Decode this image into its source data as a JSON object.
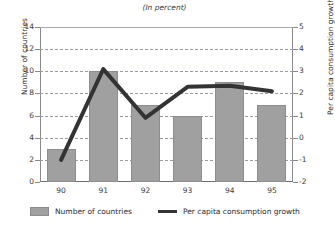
{
  "title": "Number of countries",
  "subtitle": "(In percent)",
  "chart_data": {
    "type": "bar",
    "title": "",
    "subtitle": "(In percent)",
    "xlabel": "",
    "categories": [
      "90",
      "91",
      "92",
      "93",
      "94",
      "95"
    ],
    "grid": true,
    "legend_position": "bottom",
    "series": [
      {
        "name": "Number of countries",
        "type": "bar",
        "axis": "left",
        "color": "#a0a0a0",
        "values": [
          3,
          10,
          7,
          6,
          9,
          7
        ]
      },
      {
        "name": "Per capita consumption growth",
        "type": "line",
        "axis": "right",
        "color": "#333333",
        "values": [
          -1.0,
          3.1,
          0.9,
          2.3,
          2.35,
          2.1
        ]
      }
    ],
    "left_axis": {
      "label": "Number of countries",
      "ylim": [
        0,
        14
      ],
      "ticks": [
        0,
        2,
        4,
        6,
        8,
        10,
        12,
        14
      ],
      "ticklabels": [
        "0",
        "2",
        "4",
        "6",
        "8",
        "10",
        "12",
        "14"
      ]
    },
    "right_axis": {
      "label": "Per capita consumption growth",
      "ylim": [
        -2,
        5
      ],
      "ticks": [
        -2,
        -1,
        0,
        1,
        2,
        3,
        4,
        5
      ],
      "ticklabels": [
        "-2",
        "-1",
        "0",
        "1",
        "2",
        "3",
        "4",
        "5"
      ]
    }
  },
  "legend": [
    {
      "label": "Number of countries",
      "marker": "bar-swatch",
      "color": "#a0a0a0"
    },
    {
      "label": "Per capita consumption growth",
      "marker": "line-swatch",
      "color": "#333333"
    }
  ]
}
